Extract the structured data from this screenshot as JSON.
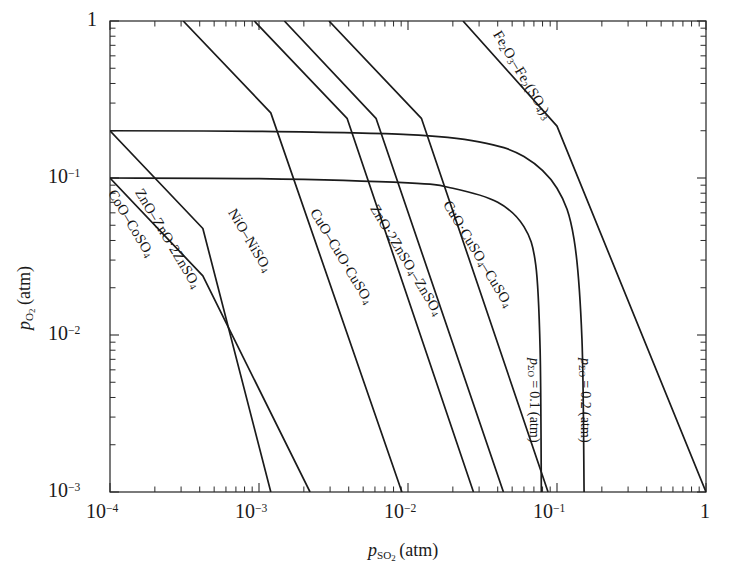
{
  "figure": {
    "kind": "predominance-diagram",
    "background_color": "#ffffff",
    "line_color": "#1b1b1b"
  },
  "axes": {
    "x": {
      "title_html": "<i>p</i><sub>SO<sub>2</sub></sub> (atm)",
      "title_plain": "p_SO2 (atm)",
      "scale": "log",
      "min": 0.0001,
      "max": 1,
      "tick_labels": [
        "10−4",
        "10−3",
        "10−2",
        "10−1",
        "1"
      ],
      "tick_values": [
        0.0001,
        0.001,
        0.01,
        0.1,
        1
      ],
      "minor_ticks": true
    },
    "y": {
      "title_html": "<i>p</i><sub>O<sub>2</sub></sub> (atm)",
      "title_plain": "p_O2 (atm)",
      "scale": "log",
      "min": 0.001,
      "max": 1,
      "tick_labels": [
        "1",
        "10−1",
        "10−2",
        "10−3"
      ],
      "tick_values": [
        1,
        0.1,
        0.01,
        0.001
      ],
      "minor_ticks": true
    }
  },
  "labels": {
    "coo": "CoO–CoSO₄",
    "zno": "ZnO–ZnO·2ZnSO₄",
    "nio": "NiO–NiSO₄",
    "cuo": "CuO–CuO·CuSO₄",
    "zno2": "ZnO·2ZnSO₄–ZnSO₄",
    "cuo2": "CuO·CuSO₄–CuSO₄",
    "fe": "Fe₂O₃–Fe₂(SO₄)₃",
    "psum01": "pΣO = 0.1 (atm)",
    "psum02": "pΣO = 0.2 (atm)"
  },
  "chart_data": {
    "type": "line",
    "title": "",
    "subtitle": "",
    "xlabel": "p_SO2 (atm)",
    "ylabel": "p_O2 (atm)",
    "xscale": "log",
    "yscale": "log",
    "xlim": [
      0.0001,
      1
    ],
    "ylim": [
      0.001,
      1
    ],
    "grid": false,
    "legend": "inline-curve-labels",
    "x_tick_labels": [
      "10^-4",
      "10^-3",
      "10^-2",
      "10^-1",
      "1"
    ],
    "y_tick_labels": [
      "1",
      "10^-1",
      "10^-2",
      "10^-3"
    ],
    "series": [
      {
        "name": "CoO–CoSO4",
        "kind": "equilibrium-boundary",
        "style": "straight",
        "slope_log": -1.0,
        "points": [
          [
            0.0001,
            0.2
          ],
          [
            0.00042,
            0.0477
          ],
          [
            0.0012,
            0.001
          ]
        ]
      },
      {
        "name": "ZnO–ZnO·2ZnSO4",
        "kind": "equilibrium-boundary",
        "style": "straight",
        "slope_log": -1.0,
        "points": [
          [
            0.0001,
            0.1
          ],
          [
            0.00042,
            0.0238
          ],
          [
            0.0022,
            0.001
          ]
        ]
      },
      {
        "name": "NiO–NiSO4",
        "kind": "equilibrium-boundary",
        "style": "straight",
        "slope_log": -1.0,
        "points": [
          [
            0.00031,
            1.0
          ],
          [
            0.0012,
            0.26
          ],
          [
            0.0091,
            0.001
          ]
        ]
      },
      {
        "name": "CuO–CuO·CuSO4",
        "kind": "equilibrium-boundary",
        "style": "straight",
        "slope_log": -1.0,
        "points": [
          [
            0.00093,
            1.0
          ],
          [
            0.0039,
            0.24
          ],
          [
            0.0275,
            0.001
          ]
        ]
      },
      {
        "name": "ZnO·2ZnSO4–ZnSO4",
        "kind": "equilibrium-boundary",
        "style": "straight",
        "slope_log": -1.0,
        "points": [
          [
            0.00148,
            1.0
          ],
          [
            0.0061,
            0.24
          ],
          [
            0.0437,
            0.001
          ]
        ]
      },
      {
        "name": "CuO·CuSO4–CuSO4",
        "kind": "equilibrium-boundary",
        "style": "straight",
        "slope_log": -1.0,
        "points": [
          [
            0.00295,
            1.0
          ],
          [
            0.0123,
            0.24
          ],
          [
            0.0871,
            0.001
          ]
        ]
      },
      {
        "name": "Fe2O3–Fe2(SO4)3",
        "kind": "equilibrium-boundary",
        "style": "straight-steep",
        "slope_log": -0.66,
        "points": [
          [
            0.0234,
            1.0
          ],
          [
            0.1,
            0.214
          ],
          [
            1.0,
            0.001
          ]
        ]
      },
      {
        "name": "pΣO = 0.1 (atm)",
        "kind": "total-pressure-contour",
        "style": "curved",
        "value": 0.1,
        "points": [
          [
            0.0001,
            0.1
          ],
          [
            0.001,
            0.099
          ],
          [
            0.01,
            0.093
          ],
          [
            0.02,
            0.086
          ],
          [
            0.04,
            0.07
          ],
          [
            0.06,
            0.049
          ],
          [
            0.072,
            0.028
          ],
          [
            0.077,
            0.0082
          ],
          [
            0.0785,
            0.001
          ]
        ]
      },
      {
        "name": "pΣO = 0.2 (atm)",
        "kind": "total-pressure-contour",
        "style": "curved",
        "value": 0.2,
        "points": [
          [
            0.0001,
            0.2
          ],
          [
            0.001,
            0.198
          ],
          [
            0.01,
            0.189
          ],
          [
            0.03,
            0.17
          ],
          [
            0.06,
            0.137
          ],
          [
            0.1,
            0.086
          ],
          [
            0.13,
            0.041
          ],
          [
            0.147,
            0.0095
          ],
          [
            0.152,
            0.001
          ]
        ]
      }
    ],
    "annotations": [
      {
        "text": "CoO–CoSO₄",
        "on_series": "CoO–CoSO4",
        "rotation_deg": 60
      },
      {
        "text": "ZnO–ZnO·2ZnSO₄",
        "on_series": "ZnO–ZnO·2ZnSO4",
        "rotation_deg": 60
      },
      {
        "text": "NiO–NiSO₄",
        "on_series": "NiO–NiSO4",
        "rotation_deg": 60
      },
      {
        "text": "CuO–CuO·CuSO₄",
        "on_series": "CuO–CuO·CuSO4",
        "rotation_deg": 60
      },
      {
        "text": "ZnO·2ZnSO₄–ZnSO₄",
        "on_series": "ZnO·2ZnSO4–ZnSO4",
        "rotation_deg": 60
      },
      {
        "text": "CuO·CuSO₄–CuSO₄",
        "on_series": "CuO·CuSO4–CuSO4",
        "rotation_deg": 60
      },
      {
        "text": "Fe₂O₃–Fe₂(SO₄)₃",
        "on_series": "Fe2O3–Fe2(SO4)3",
        "rotation_deg": 60
      },
      {
        "text": "pΣO = 0.1 (atm)",
        "on_series": "pΣO = 0.1 (atm)",
        "rotation_deg": 90
      },
      {
        "text": "pΣO = 0.2 (atm)",
        "on_series": "pΣO = 0.2 (atm)",
        "rotation_deg": 90
      }
    ]
  }
}
